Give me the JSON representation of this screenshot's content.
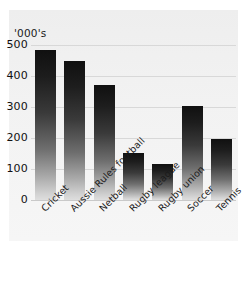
{
  "chart_data": {
    "type": "bar",
    "title": "",
    "subtitle": "",
    "xlabel": "",
    "ylabel": "'000's",
    "ylim": [
      0,
      500
    ],
    "yticks": [
      0,
      100,
      200,
      300,
      400,
      500
    ],
    "ytick_labels": [
      "0",
      "100",
      "200",
      "300",
      "400",
      "500"
    ],
    "grid": true,
    "legend": false,
    "categories": [
      "Cricket",
      "Aussie Rules football",
      "Netball",
      "Rugby league",
      "Rugby union",
      "Soccer",
      "Tennis"
    ],
    "values": [
      485,
      450,
      370,
      152,
      115,
      302,
      198
    ],
    "units_note": "'000's",
    "annotations": []
  },
  "style": {
    "panel_background": "#f2f2f2",
    "page_background": "#ffffff",
    "gridline_color": "#d8d8d8",
    "bar_top_color": "#101010",
    "bar_bottom_color": "#dedede",
    "text_color": "#1a1a1a"
  }
}
